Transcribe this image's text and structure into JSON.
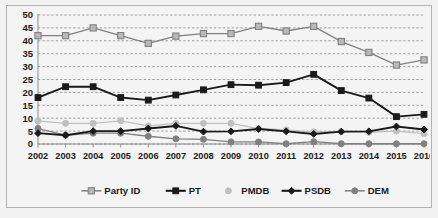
{
  "chart_data": {
    "type": "line",
    "title": "",
    "subtitle": "",
    "xlabel": "",
    "ylabel": "",
    "x": [
      2002,
      2003,
      2004,
      2005,
      2006,
      2007,
      2008,
      2009,
      2010,
      2011,
      2012,
      2013,
      2014,
      2015,
      2016
    ],
    "categories": [
      "2002",
      "2003",
      "2004",
      "2005",
      "2006",
      "2007",
      "2008",
      "2009",
      "2010",
      "2011",
      "2012",
      "2013",
      "2014",
      "2015",
      "2016"
    ],
    "ylim": [
      0,
      50
    ],
    "yticks": [
      0,
      5,
      10,
      15,
      20,
      25,
      30,
      35,
      40,
      45,
      50
    ],
    "ytick_labels": [
      "0",
      "5",
      "10",
      "15",
      "20",
      "25",
      "30",
      "35",
      "40",
      "45",
      "50"
    ],
    "grid": true,
    "grid_style": "dashed horizontal",
    "legend_position": "bottom",
    "series": [
      {
        "name": "Party ID",
        "color": "#808080",
        "marker": "square-open",
        "values": [
          42,
          42,
          45,
          42,
          39,
          41.8,
          42.8,
          42.8,
          45.6,
          43.8,
          45.6,
          39.7,
          35.5,
          30.6,
          32.6
        ]
      },
      {
        "name": "PT",
        "color": "#1a1a1a",
        "marker": "square-filled",
        "values": [
          18,
          22.2,
          22.2,
          18,
          17,
          19,
          21,
          23,
          22.8,
          23.8,
          27,
          20.7,
          17.8,
          10.6,
          11.5
        ]
      },
      {
        "name": "PMDB",
        "color": "#c0c0c0",
        "marker": "circle-filled",
        "values": [
          9,
          8,
          8,
          9,
          7,
          8,
          8,
          8,
          6,
          5.5,
          4.7,
          4.8,
          4.5,
          5,
          4
        ]
      },
      {
        "name": "PSDB",
        "color": "#1a1a1a",
        "marker": "diamond-filled",
        "values": [
          4.2,
          3.4,
          5,
          5,
          6,
          7,
          4.8,
          4.9,
          5.8,
          4.9,
          3.9,
          4.8,
          4.9,
          6.8,
          5.6
        ]
      },
      {
        "name": "DEM",
        "color": "#808080",
        "marker": "circle-filled",
        "values": [
          6,
          3.4,
          4.2,
          4.2,
          3,
          2,
          1.8,
          0.8,
          0.8,
          0.1,
          0.9,
          0.1,
          0.1,
          0.1,
          0.1
        ]
      }
    ]
  },
  "legend": {
    "items": [
      {
        "label": "Party ID"
      },
      {
        "label": "PT"
      },
      {
        "label": "PMDB"
      },
      {
        "label": "PSDB"
      },
      {
        "label": "DEM"
      }
    ]
  },
  "axes": {
    "y_labels": [
      "50",
      "45",
      "40",
      "35",
      "30",
      "25",
      "20",
      "15",
      "10",
      "5",
      "0"
    ],
    "x_labels": [
      "2002",
      "2003",
      "2004",
      "2005",
      "2006",
      "2007",
      "2008",
      "2009",
      "2010",
      "2011",
      "2012",
      "2013",
      "2014",
      "2015",
      "2016"
    ]
  },
  "colors": {
    "plot_background": "#f4f4f4",
    "frame_background": "#f2f2f2",
    "border": "#b3b3b3",
    "gridline": "#7a7a7a",
    "axis": "#8c8c8c",
    "text": "#1a1a1a",
    "party_id": "#808080",
    "pt": "#1a1a1a",
    "pmdb": "#c0c0c0",
    "psdb": "#1a1a1a",
    "dem": "#808080"
  }
}
